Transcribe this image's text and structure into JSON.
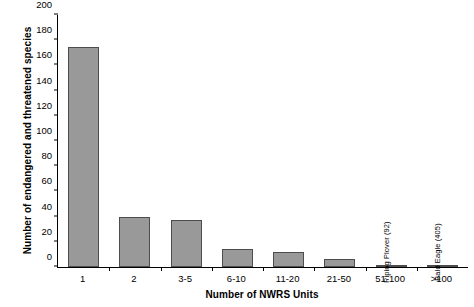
{
  "chart_data": {
    "type": "bar",
    "title": "",
    "xlabel": "Number of NWRS Units",
    "ylabel": "Number of endangered and threatened species",
    "categories": [
      "1",
      "2",
      "3-5",
      "6-10",
      "11-20",
      "21-50",
      "51-100",
      ">100"
    ],
    "values": [
      175,
      40,
      37,
      14,
      12,
      6,
      1,
      1
    ],
    "ylim": [
      0,
      200
    ],
    "ytick_labels": [
      "0",
      "20",
      "40",
      "60",
      "80",
      "100",
      "120",
      "140",
      "160",
      "180",
      "200"
    ],
    "ytick_values": [
      0,
      20,
      40,
      60,
      80,
      100,
      120,
      140,
      160,
      180,
      200
    ],
    "grid": false,
    "legend": "none",
    "annotations": [
      {
        "category": "51-100",
        "text": "Piping Plover (92)"
      },
      {
        "category": ">100",
        "text": "Bald Eagle (405)"
      }
    ],
    "colors": {
      "bar_fill": "#999999",
      "bar_border": "#4d4d4d",
      "axis": "#000000",
      "text": "#000000",
      "background": "#ffffff"
    }
  }
}
